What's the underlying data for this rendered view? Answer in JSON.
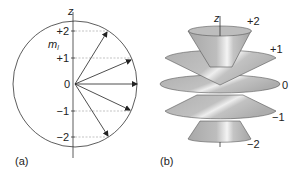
{
  "panel_a": {
    "caption": "(a)",
    "axis_label": "z",
    "quantum_label": "m",
    "quantum_subscript": "l",
    "levels": [
      "+2",
      "+1",
      "0",
      "−1",
      "−2"
    ]
  },
  "panel_b": {
    "caption": "(b)",
    "axis_label": "z",
    "levels": [
      "+2",
      "+1",
      "0",
      "−1",
      "−2"
    ]
  },
  "colors": {
    "line": "#333333",
    "dashed": "#9a9a9a",
    "surface": "#b4b4b4",
    "highlight": "#f2f2f2"
  }
}
